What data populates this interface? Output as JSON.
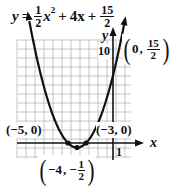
{
  "equation": {
    "lhs": "y",
    "equals": "=",
    "a_num": "1",
    "a_den": "2",
    "x_var": "x",
    "x_exp": "2",
    "plus1": "+",
    "b_term": "4x",
    "plus2": "+",
    "c_num": "15",
    "c_den": "2"
  },
  "axes": {
    "x_label": "x",
    "y_label": "y",
    "x_tick_label": "1",
    "y_tick_label": "10"
  },
  "points": {
    "y_intercept": {
      "open": "(",
      "x": "0",
      "sep": ",",
      "num": "15",
      "den": "2",
      "close": ")"
    },
    "left_root": "(−5, 0)",
    "right_root": "(−3, 0)",
    "vertex": {
      "open": "(",
      "x": "−4",
      "sep": ",",
      "sign": "−",
      "num": "1",
      "den": "2",
      "close": ")"
    }
  },
  "chart_data": {
    "type": "line",
    "xlabel": "x",
    "ylabel": "y",
    "xlim": [
      -10.5,
      2
    ],
    "ylim": [
      -1.5,
      11.5
    ],
    "grid": true,
    "tick_labels": {
      "x": [
        "1"
      ],
      "y": [
        "10"
      ]
    },
    "function": {
      "a": 0.5,
      "b": 4,
      "c": 7.5
    },
    "series": [
      {
        "name": "y = 1/2 x^2 + 4x + 15/2",
        "x": [
          -9.3,
          -9,
          -8,
          -7,
          -6,
          -5,
          -4,
          -3,
          -2,
          -1,
          0,
          0.3
        ],
        "y": [
          5.55,
          4,
          0,
          0.5,
          1.5,
          0,
          -0.5,
          0,
          1.5,
          4,
          7.5,
          8.74
        ]
      }
    ],
    "annotations": [
      {
        "label": "(0, 15/2)",
        "x": 0,
        "y": 7.5
      },
      {
        "label": "(−5, 0)",
        "x": -5,
        "y": 0
      },
      {
        "label": "(−3, 0)",
        "x": -3,
        "y": 0
      },
      {
        "label": "(−4, −1/2)",
        "x": -4,
        "y": -0.5
      }
    ]
  }
}
